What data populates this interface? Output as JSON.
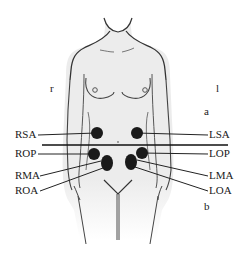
{
  "diagram": {
    "side_labels": {
      "right": "r",
      "left": "l"
    },
    "panel_labels": {
      "upper": "a",
      "lower": "b"
    },
    "positions": [
      {
        "label": "RSA",
        "side": "right",
        "dot": [
          96,
          133
        ]
      },
      {
        "label": "ROP",
        "side": "right",
        "dot": [
          94,
          154
        ]
      },
      {
        "label": "RMA",
        "side": "right",
        "dot": [
          107,
          160
        ]
      },
      {
        "label": "ROA",
        "side": "right",
        "dot": [
          107,
          166
        ]
      },
      {
        "label": "LSA",
        "side": "left",
        "dot": [
          137,
          133
        ]
      },
      {
        "label": "LOP",
        "side": "left",
        "dot": [
          142,
          153
        ]
      },
      {
        "label": "LMA",
        "side": "left",
        "dot": [
          131,
          159
        ]
      },
      {
        "label": "LOA",
        "side": "left",
        "dot": [
          131,
          165
        ]
      }
    ],
    "colors": {
      "outline": "#333333",
      "body_fill": "#ececec",
      "dot": "#1a1a1a",
      "text": "#1a1a1a"
    }
  }
}
